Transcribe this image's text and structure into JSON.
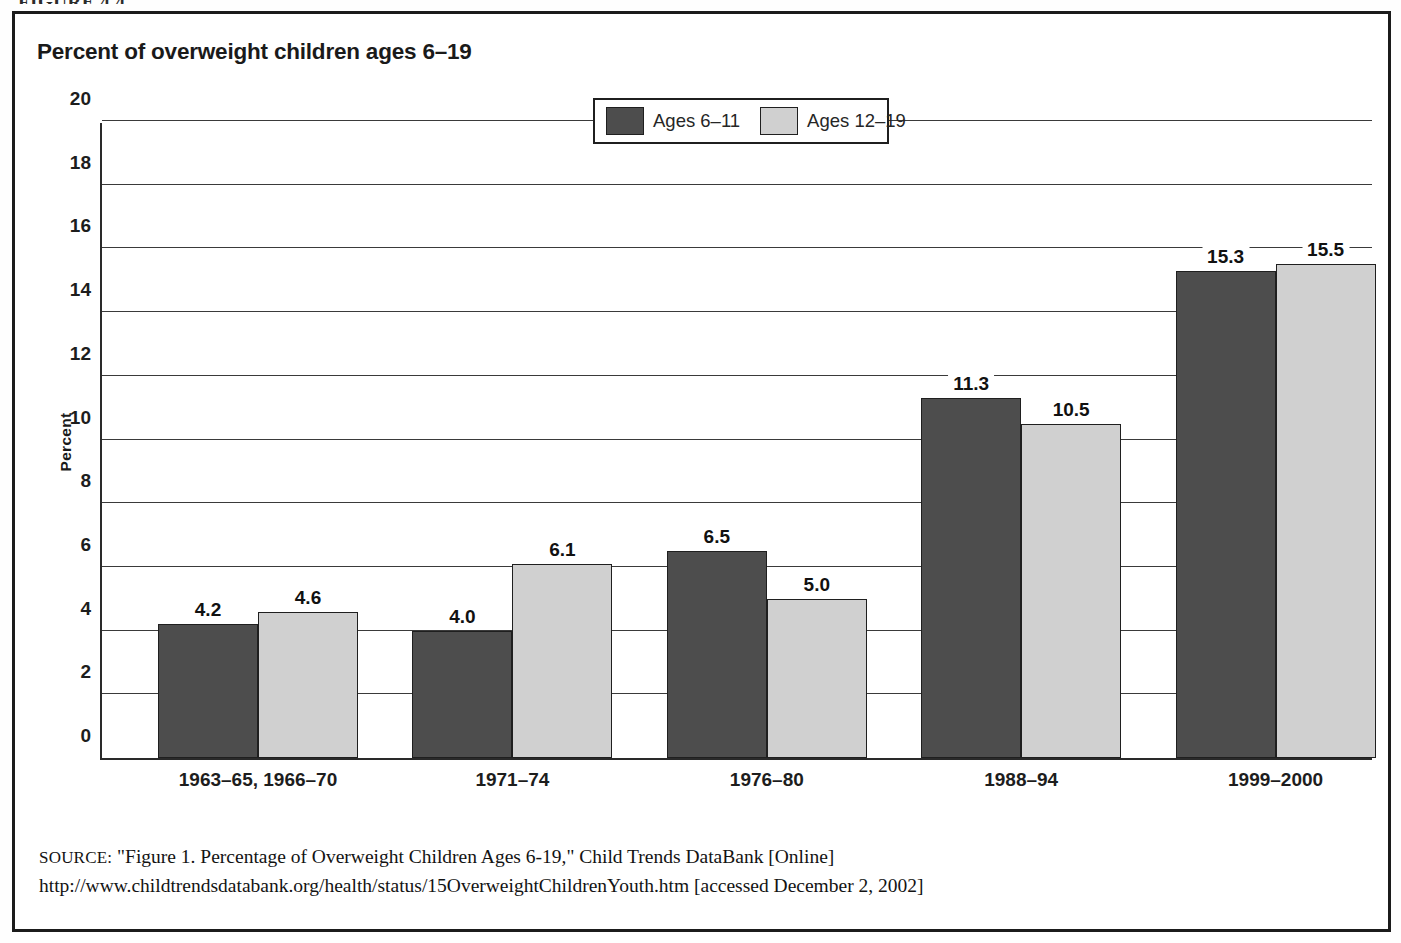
{
  "figure": {
    "caption": "FIGURE 4.4"
  },
  "chart_title": "Percent of overweight children ages 6–19",
  "legend": {
    "entries": [
      {
        "label": "Ages 6–11",
        "color": "#4d4d4d"
      },
      {
        "label": "Ages 12–19",
        "color": "#d0d0d0"
      }
    ]
  },
  "source": {
    "label": "SOURCE:",
    "text": " \"Figure 1. Percentage of Overweight Children Ages 6-19,\" Child Trends DataBank [Online] http://www.childtrendsdatabank.org/health/status/15OverweightChildrenYouth.htm [accessed December 2, 2002]"
  },
  "chart_data": {
    "type": "bar",
    "title": "Percent of overweight children ages 6–19",
    "xlabel": "",
    "ylabel": "Percent",
    "ylim": [
      0,
      20
    ],
    "yticks": [
      0,
      2,
      4,
      6,
      8,
      10,
      12,
      14,
      16,
      18,
      20
    ],
    "ytick_labels": [
      "0",
      "2",
      "4",
      "6",
      "8",
      "10",
      "12",
      "14",
      "16",
      "18",
      "20"
    ],
    "grid": true,
    "legend_position": "top-center",
    "categories": [
      "1963–65, 1966–70",
      "1971–74",
      "1976–80",
      "1988–94",
      "1999–2000"
    ],
    "series": [
      {
        "name": "Ages 6–11",
        "color": "#4d4d4d",
        "values": [
          4.2,
          4.0,
          6.5,
          11.3,
          15.3
        ],
        "value_labels": [
          "4.2",
          "4.0",
          "6.5",
          "11.3",
          "15.3"
        ]
      },
      {
        "name": "Ages 12–19",
        "color": "#d0d0d0",
        "values": [
          4.6,
          6.1,
          5.0,
          10.5,
          15.5
        ],
        "value_labels": [
          "4.6",
          "6.1",
          "5.0",
          "10.5",
          "15.5"
        ]
      }
    ]
  }
}
